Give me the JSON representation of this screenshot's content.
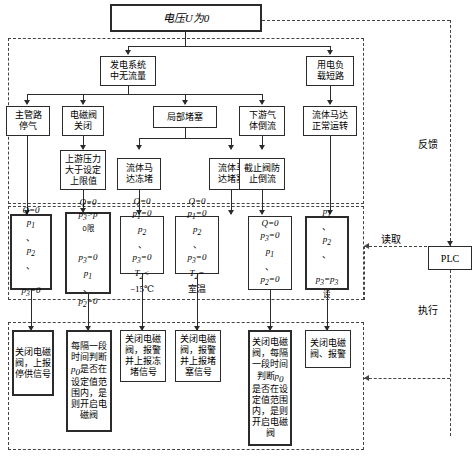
{
  "diagram": {
    "title_box": "电压U为0",
    "zones": {
      "feedback_label": "反馈",
      "read_label": "读取",
      "execute_label": "执行",
      "plc_label": "PLC"
    },
    "level2": [
      {
        "name": "no-flow-in-power-system",
        "text": "发电系统\n中无流量"
      },
      {
        "name": "load-short-circuit",
        "text": "用电负\n载短路"
      }
    ],
    "level3": [
      {
        "name": "main-pipe-gas-stop",
        "text": "主管路\n停气"
      },
      {
        "name": "solenoid-valve-closed",
        "text": "电磁阀\n关闭"
      },
      {
        "name": "local-blockage",
        "text": "局部堵塞"
      },
      {
        "name": "downstream-gas-backflow",
        "text": "下游气\n体倒流"
      },
      {
        "name": "fluid-motor-normal",
        "text": "流体马达\n正常运转"
      }
    ],
    "level4": [
      {
        "name": "upstream-pressure-over-limit",
        "text": "上游压力\n大于设定\n上限值"
      },
      {
        "name": "fluid-motor-frozen",
        "text": "流体马\n达冻堵"
      },
      {
        "name": "fluid-motor-blocked",
        "text": "流体马\n达堵塞"
      },
      {
        "name": "stop-valve-prevent-backflow",
        "text": "截止阀防\n止倒流"
      }
    ],
    "signals": [
      {
        "name": "signal-1",
        "lines": [
          "Q=0",
          "p₁、p₂、",
          "p₃=0"
        ]
      },
      {
        "name": "signal-2",
        "lines": [
          "Q=0",
          "p₃>p₀限",
          "p₃=0",
          "p₁、p₂=0"
        ]
      },
      {
        "name": "signal-3",
        "lines": [
          "Q=0",
          "p₁=0",
          "p₂、p₃=0",
          "T₂<−15℃"
        ]
      },
      {
        "name": "signal-4",
        "lines": [
          "Q=0",
          "p₁=0",
          "p₂、p₃=0",
          "T₂=室温"
        ]
      },
      {
        "name": "signal-5",
        "lines": [
          "Q=0",
          "p₃=0",
          "p₁、p₂=0"
        ]
      },
      {
        "name": "signal-6",
        "lines": [
          "p₁、p₂、",
          "p₃=p₃设"
        ]
      }
    ],
    "actions": [
      {
        "name": "action-1",
        "text": "关闭电磁\n阀，上报\n停供信号"
      },
      {
        "name": "action-2",
        "text": "每隔一段\n时间判断\np₀是否在\n设定值范\n围内，是\n则开启电\n磁阀"
      },
      {
        "name": "action-3",
        "text": "关闭电磁\n阀，报警\n并上报冻\n堵信号"
      },
      {
        "name": "action-4",
        "text": "关闭电磁\n阀，报警\n并上报堵\n塞信号"
      },
      {
        "name": "action-5",
        "text": "关闭电磁\n阀，每隔\n一段时间\n判断p₀\n是否在设\n定值范围\n内，是则\n开启电磁\n阀"
      },
      {
        "name": "action-6",
        "text": "关闭电磁\n阀、报警"
      }
    ],
    "colors": {
      "line": "#2b2b2b",
      "dash": "#444444",
      "bg": "#ffffff"
    }
  }
}
